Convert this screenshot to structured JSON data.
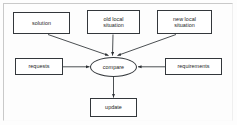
{
  "diagram": {
    "colors": {
      "stroke": "#33373b",
      "edge": "#2b2f33",
      "node_fill": "#ffffff",
      "background": "#fdfdfd",
      "text": "#1d1d1d"
    },
    "nodes": [
      {
        "id": "solution",
        "label": "solution",
        "shape": "box",
        "x": 13,
        "y": 12,
        "w": 57,
        "h": 22
      },
      {
        "id": "old_local",
        "label": "old local\nsituation",
        "shape": "box",
        "x": 87,
        "y": 10,
        "w": 53,
        "h": 24
      },
      {
        "id": "new_local",
        "label": "new local\nsituation",
        "shape": "box",
        "x": 157,
        "y": 10,
        "w": 55,
        "h": 24
      },
      {
        "id": "requests",
        "label": "requests",
        "shape": "box",
        "x": 15,
        "y": 58,
        "w": 48,
        "h": 17
      },
      {
        "id": "compare",
        "label": "compare",
        "shape": "ellipse",
        "x": 90,
        "y": 57,
        "w": 47,
        "h": 20
      },
      {
        "id": "requirements",
        "label": "requirements",
        "shape": "box",
        "x": 165,
        "y": 58,
        "w": 57,
        "h": 17
      },
      {
        "id": "update",
        "label": "update",
        "shape": "box",
        "x": 90,
        "y": 98,
        "w": 47,
        "h": 19
      }
    ],
    "edges": [
      {
        "id": "solution-to-compare",
        "from": "solution",
        "to": "compare",
        "arrow": "target",
        "label": ""
      },
      {
        "id": "old-local-to-compare",
        "from": "old_local",
        "to": "compare",
        "arrow": "target",
        "label": ""
      },
      {
        "id": "new-local-to-compare",
        "from": "new_local",
        "to": "compare",
        "arrow": "target",
        "label": ""
      },
      {
        "id": "requests-to-compare",
        "from": "requests",
        "to": "compare",
        "arrow": "target",
        "label": ""
      },
      {
        "id": "requirements-to-compare",
        "from": "requirements",
        "to": "compare",
        "arrow": "target",
        "label": ""
      },
      {
        "id": "compare-to-update",
        "from": "compare",
        "to": "update",
        "arrow": "target",
        "label": ""
      }
    ]
  }
}
